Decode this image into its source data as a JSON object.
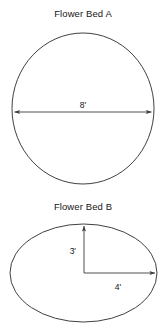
{
  "figure": {
    "background_color": "#ffffff",
    "stroke_color": "#2a2a2a",
    "text_color": "#161616"
  },
  "bed_a": {
    "title": "Flower Bed A",
    "shape": "circle",
    "dimension_label": "8'",
    "dimension_type": "diameter",
    "dimension_value": 8,
    "dimension_unit": "feet"
  },
  "bed_b": {
    "title": "Flower Bed B",
    "shape": "ellipse",
    "vertical_label": "3'",
    "vertical_value": 3,
    "horizontal_label": "4'",
    "horizontal_value": 4,
    "dimension_unit": "feet",
    "vertical_type": "semi-minor axis",
    "horizontal_type": "semi-major axis"
  }
}
